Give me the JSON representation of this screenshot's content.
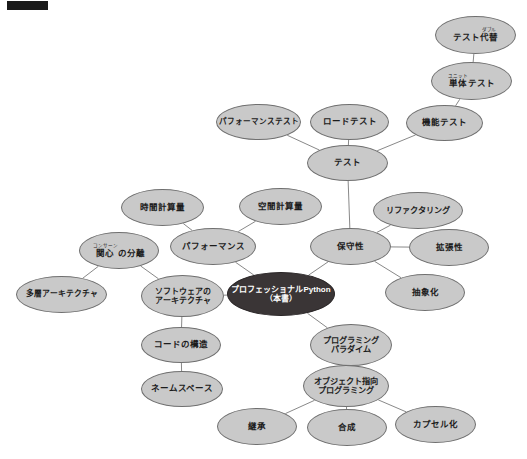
{
  "diagram": {
    "background_color": "#ffffff",
    "node_fill": "#c9c9c9",
    "node_stroke": "#6f6f6f",
    "root_fill": "#3a3536",
    "root_text_color": "#ffffff",
    "edge_color": "#7a7a7a",
    "redaction": {
      "label": "redaction-bar",
      "color": "#1a1a1a",
      "x": 7,
      "y": 1,
      "width": 41,
      "height": 9
    }
  },
  "nodes": [
    {
      "id": "test-double",
      "text": "テスト代替",
      "ruby_base": "代替",
      "ruby_text": "ダブル",
      "pre_ruby": "テスト",
      "x": 435,
      "y": 16,
      "w": 81,
      "h": 38,
      "font": 8.5,
      "dark": false
    },
    {
      "id": "unit-test",
      "text": "単体テスト",
      "ruby_base": "単体",
      "ruby_text": "ユニット",
      "post_ruby": "テスト",
      "x": 431,
      "y": 62,
      "w": 81,
      "h": 38,
      "font": 8.5,
      "dark": false
    },
    {
      "id": "functional-test",
      "text": "機能テスト",
      "x": 406,
      "y": 105,
      "w": 77,
      "h": 36,
      "font": 8.5,
      "dark": false
    },
    {
      "id": "load-test",
      "text": "ロードテスト",
      "x": 310,
      "y": 104,
      "w": 79,
      "h": 36,
      "font": 8.5,
      "dark": false
    },
    {
      "id": "performance-test",
      "text": "パフォーマンステスト",
      "x": 216,
      "y": 104,
      "w": 85,
      "h": 36,
      "font": 7.6,
      "dark": false
    },
    {
      "id": "test",
      "text": "テスト",
      "x": 307,
      "y": 145,
      "w": 81,
      "h": 36,
      "font": 8.5,
      "dark": false
    },
    {
      "id": "time-complexity",
      "text": "時間計算量",
      "x": 121,
      "y": 189,
      "w": 83,
      "h": 37,
      "font": 8.5,
      "dark": false
    },
    {
      "id": "space-complexity",
      "text": "空間計算量",
      "x": 239,
      "y": 188,
      "w": 83,
      "h": 37,
      "font": 8.5,
      "dark": false
    },
    {
      "id": "refactoring",
      "text": "リファクタリング",
      "x": 373,
      "y": 192,
      "w": 90,
      "h": 37,
      "font": 8.2,
      "dark": false
    },
    {
      "id": "performance",
      "text": "パフォーマンス",
      "x": 170,
      "y": 228,
      "w": 86,
      "h": 37,
      "font": 8.5,
      "dark": false
    },
    {
      "id": "maintainability",
      "text": "保守性",
      "x": 310,
      "y": 228,
      "w": 81,
      "h": 37,
      "font": 8.5,
      "dark": false
    },
    {
      "id": "extensibility",
      "text": "拡張性",
      "x": 409,
      "y": 229,
      "w": 80,
      "h": 37,
      "font": 8.5,
      "dark": false
    },
    {
      "id": "separation-of-concerns",
      "text": "関心の分離",
      "ruby_base": "関心",
      "ruby_text": "コンサーン",
      "post_ruby": "の分離",
      "x": 79,
      "y": 232,
      "w": 80,
      "h": 37,
      "font": 8.5,
      "dark": false
    },
    {
      "id": "abstraction",
      "text": "抽象化",
      "x": 385,
      "y": 274,
      "w": 80,
      "h": 37,
      "font": 8.5,
      "dark": false
    },
    {
      "id": "layered-architecture",
      "text": "多層アーキテクチャ",
      "x": 16,
      "y": 276,
      "w": 91,
      "h": 37,
      "font": 7.8,
      "dark": false
    },
    {
      "id": "software-architecture",
      "text": "ソフトウェアの アーキテクチャ",
      "line1": "ソフトウェアの",
      "line2": "アーキテクチャ",
      "x": 141,
      "y": 275,
      "w": 83,
      "h": 42,
      "font": 8.0,
      "dark": false
    },
    {
      "id": "root",
      "text": "プロフェッショナルPython （本書）",
      "line1": "プロフェッショナルPython",
      "line2": "（本書）",
      "x": 227,
      "y": 272,
      "w": 108,
      "h": 44,
      "font": 8.0,
      "dark": true
    },
    {
      "id": "programming-paradigm",
      "text": "プログラミング パラダイム",
      "line1": "プログラミング",
      "line2": "パラダイム",
      "x": 310,
      "y": 324,
      "w": 82,
      "h": 42,
      "font": 8.2,
      "dark": false
    },
    {
      "id": "code-structure",
      "text": "コードの構造",
      "x": 141,
      "y": 327,
      "w": 80,
      "h": 36,
      "font": 8.5,
      "dark": false
    },
    {
      "id": "oop",
      "text": "オブジェクト指向 プログラミング",
      "line1": "オブジェクト指向",
      "line2": "プログラミング",
      "x": 303,
      "y": 365,
      "w": 86,
      "h": 42,
      "font": 8.2,
      "dark": false
    },
    {
      "id": "namespace",
      "text": "ネームスペース",
      "x": 141,
      "y": 371,
      "w": 82,
      "h": 36,
      "font": 8.5,
      "dark": false
    },
    {
      "id": "inheritance",
      "text": "継承",
      "x": 217,
      "y": 408,
      "w": 80,
      "h": 37,
      "font": 8.5,
      "dark": false
    },
    {
      "id": "composition",
      "text": "合成",
      "x": 307,
      "y": 409,
      "w": 80,
      "h": 37,
      "font": 8.5,
      "dark": false
    },
    {
      "id": "encapsulation",
      "text": "カプセル化",
      "x": 395,
      "y": 406,
      "w": 81,
      "h": 37,
      "font": 8.5,
      "dark": false
    }
  ],
  "edges": [
    {
      "from": "test-double",
      "to": "unit-test"
    },
    {
      "from": "unit-test",
      "to": "functional-test"
    },
    {
      "from": "functional-test",
      "to": "test"
    },
    {
      "from": "load-test",
      "to": "test"
    },
    {
      "from": "performance-test",
      "to": "test"
    },
    {
      "from": "test",
      "to": "maintainability"
    },
    {
      "from": "time-complexity",
      "to": "performance"
    },
    {
      "from": "space-complexity",
      "to": "performance"
    },
    {
      "from": "performance",
      "to": "root"
    },
    {
      "from": "maintainability",
      "to": "refactoring"
    },
    {
      "from": "maintainability",
      "to": "extensibility"
    },
    {
      "from": "maintainability",
      "to": "abstraction"
    },
    {
      "from": "maintainability",
      "to": "root"
    },
    {
      "from": "separation-of-concerns",
      "to": "layered-architecture"
    },
    {
      "from": "separation-of-concerns",
      "to": "software-architecture"
    },
    {
      "from": "software-architecture",
      "to": "root"
    },
    {
      "from": "software-architecture",
      "to": "code-structure"
    },
    {
      "from": "code-structure",
      "to": "namespace"
    },
    {
      "from": "root",
      "to": "programming-paradigm"
    },
    {
      "from": "programming-paradigm",
      "to": "oop"
    },
    {
      "from": "oop",
      "to": "inheritance"
    },
    {
      "from": "oop",
      "to": "composition"
    },
    {
      "from": "oop",
      "to": "encapsulation"
    }
  ]
}
